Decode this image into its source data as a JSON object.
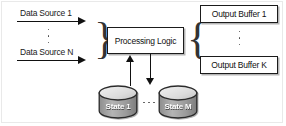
{
  "diagram": {
    "inputs": {
      "first_label": "Data Source 1",
      "last_label": "Data Source N",
      "ellipsis": "⋮"
    },
    "processor": {
      "label": "Processing Logic"
    },
    "outputs": {
      "first_label": "Output Buffer 1",
      "last_label": "Output Buffer K",
      "ellipsis": "⋮"
    },
    "state_stores": {
      "first_label": "State 1",
      "last_label": "State M",
      "ellipsis": "⋯"
    },
    "braces": {
      "left": "}",
      "right": "{"
    },
    "colors": {
      "stroke": "#1b1b1b",
      "background": "#ffffff",
      "shadow": "#808080",
      "cylinder_top": "#e8e8e8",
      "cylinder_body": "#9a9a9a",
      "label_text": "#ffffff",
      "frame": "#e9e9e9"
    }
  }
}
